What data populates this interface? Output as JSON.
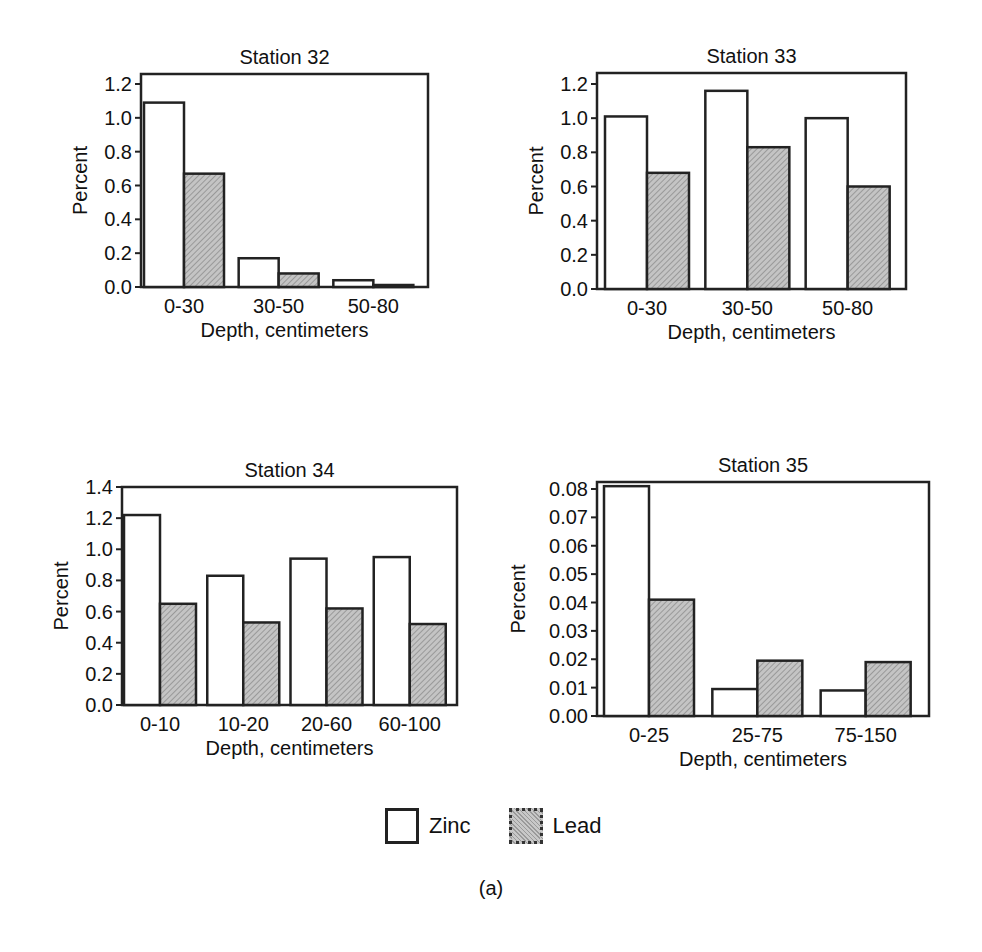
{
  "legend": {
    "zinc_label": "Zinc",
    "lead_label": "Lead"
  },
  "caption": "(a)",
  "colors": {
    "zinc_fill": "#ffffff",
    "lead_fill": "#b5b5b5",
    "stroke": "#222222"
  },
  "chart_data": [
    {
      "type": "bar",
      "title": "Station 32",
      "xlabel": "Depth, centimeters",
      "ylabel": "Percent",
      "categories": [
        "0-30",
        "30-50",
        "50-80"
      ],
      "series": [
        {
          "name": "Zinc",
          "values": [
            1.09,
            0.17,
            0.04
          ]
        },
        {
          "name": "Lead",
          "values": [
            0.67,
            0.08,
            0.01
          ]
        }
      ],
      "yticks": [
        "0.0",
        "0.2",
        "0.4",
        "0.6",
        "0.8",
        "1.0",
        "1.2"
      ],
      "ylim": [
        0,
        1.2
      ],
      "grid": false,
      "legend_position": "bottom-shared"
    },
    {
      "type": "bar",
      "title": "Station 33",
      "xlabel": "Depth, centimeters",
      "ylabel": "Percent",
      "categories": [
        "0-30",
        "30-50",
        "50-80"
      ],
      "series": [
        {
          "name": "Zinc",
          "values": [
            1.01,
            1.16,
            1.0
          ]
        },
        {
          "name": "Lead",
          "values": [
            0.68,
            0.83,
            0.6
          ]
        }
      ],
      "yticks": [
        "0.0",
        "0.2",
        "0.4",
        "0.6",
        "0.8",
        "1.0",
        "1.2"
      ],
      "ylim": [
        0,
        1.2
      ],
      "grid": false,
      "legend_position": "bottom-shared"
    },
    {
      "type": "bar",
      "title": "Station 34",
      "xlabel": "Depth, centimeters",
      "ylabel": "Percent",
      "categories": [
        "0-10",
        "10-20",
        "20-60",
        "60-100"
      ],
      "series": [
        {
          "name": "Zinc",
          "values": [
            1.22,
            0.83,
            0.94,
            0.95
          ]
        },
        {
          "name": "Lead",
          "values": [
            0.65,
            0.53,
            0.62,
            0.52
          ]
        }
      ],
      "yticks": [
        "0.0",
        "0.2",
        "0.4",
        "0.6",
        "0.8",
        "1.0",
        "1.2",
        "1.4"
      ],
      "ylim": [
        0,
        1.4
      ],
      "grid": false,
      "legend_position": "bottom-shared"
    },
    {
      "type": "bar",
      "title": "Station 35",
      "xlabel": "Depth, centimeters",
      "ylabel": "Percent",
      "categories": [
        "0-25",
        "25-75",
        "75-150"
      ],
      "series": [
        {
          "name": "Zinc",
          "values": [
            0.081,
            0.0095,
            0.009
          ]
        },
        {
          "name": "Lead",
          "values": [
            0.041,
            0.0195,
            0.019
          ]
        }
      ],
      "yticks": [
        "0.00",
        "0.01",
        "0.02",
        "0.03",
        "0.04",
        "0.05",
        "0.06",
        "0.07",
        "0.08"
      ],
      "ylim": [
        0,
        0.08
      ],
      "grid": false,
      "legend_position": "bottom-shared"
    }
  ]
}
